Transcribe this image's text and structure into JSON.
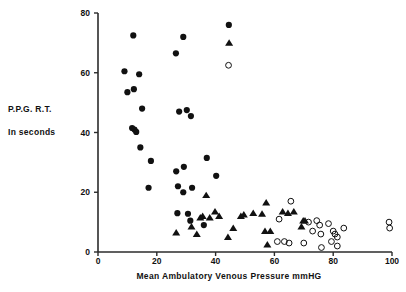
{
  "figure": {
    "background": "#ffffff",
    "foreground": "#111111",
    "axis_color": "#2b2b2b"
  },
  "labels": {
    "ylabel_line1": "P.P.G. R.T.",
    "ylabel_line2": "In seconds",
    "xlabel": "Mean Ambulatory Venous Pressure mmHG"
  },
  "chart_data": {
    "type": "scatter",
    "title": "",
    "xlabel": "Mean Ambulatory Venous Pressure mmHG",
    "ylabel": "P.P.G. R.T. In seconds",
    "xlim": [
      0,
      100
    ],
    "ylim": [
      0,
      80
    ],
    "xticks": [
      0,
      20,
      40,
      60,
      80,
      100
    ],
    "yticks": [
      0,
      20,
      40,
      60,
      80
    ],
    "grid": false,
    "legend": "none",
    "series": [
      {
        "name": "filled-circle",
        "marker": "filled-circle",
        "color": "#111111",
        "points": [
          [
            12.0,
            72.5
          ],
          [
            9.0,
            60.5
          ],
          [
            14.0,
            59.5
          ],
          [
            10.0,
            53.5
          ],
          [
            12.2,
            54.5
          ],
          [
            11.6,
            41.5
          ],
          [
            12.4,
            41.0
          ],
          [
            13.0,
            40.2
          ],
          [
            15.0,
            48.0
          ],
          [
            14.4,
            35.0
          ],
          [
            18.0,
            30.5
          ],
          [
            17.2,
            21.5
          ],
          [
            26.5,
            66.5
          ],
          [
            29.0,
            72.0
          ],
          [
            27.6,
            47.0
          ],
          [
            30.2,
            47.5
          ],
          [
            31.6,
            45.5
          ],
          [
            26.6,
            27.0
          ],
          [
            29.2,
            28.5
          ],
          [
            27.2,
            22.0
          ],
          [
            29.0,
            20.0
          ],
          [
            32.0,
            21.5
          ],
          [
            37.0,
            31.5
          ],
          [
            40.2,
            25.5
          ],
          [
            44.5,
            76.0
          ],
          [
            27.0,
            13.0
          ],
          [
            30.6,
            12.8
          ],
          [
            31.4,
            10.5
          ],
          [
            36.0,
            9.0
          ]
        ]
      },
      {
        "name": "filled-triangle",
        "marker": "filled-triangle",
        "color": "#111111",
        "points": [
          [
            44.6,
            70.0
          ],
          [
            36.8,
            19.0
          ],
          [
            26.6,
            6.5
          ],
          [
            31.8,
            8.5
          ],
          [
            33.6,
            6.0
          ],
          [
            34.8,
            11.5
          ],
          [
            35.6,
            12.0
          ],
          [
            38.0,
            11.5
          ],
          [
            39.8,
            13.5
          ],
          [
            41.2,
            12.0
          ],
          [
            44.2,
            5.0
          ],
          [
            46.0,
            8.0
          ],
          [
            48.6,
            12.0
          ],
          [
            49.6,
            12.5
          ],
          [
            52.8,
            13.0
          ],
          [
            55.8,
            12.8
          ],
          [
            57.2,
            16.5
          ],
          [
            56.8,
            7.0
          ],
          [
            58.6,
            7.0
          ],
          [
            57.6,
            2.5
          ],
          [
            62.8,
            13.5
          ],
          [
            64.6,
            13.0
          ],
          [
            66.6,
            13.5
          ],
          [
            69.8,
            10.5
          ],
          [
            69.2,
            8.5
          ],
          [
            70.4,
            10.5
          ]
        ]
      },
      {
        "name": "open-circle",
        "marker": "open-circle",
        "color": "#111111",
        "points": [
          [
            44.4,
            62.5
          ],
          [
            65.6,
            17.0
          ],
          [
            61.6,
            11.0
          ],
          [
            61.0,
            3.5
          ],
          [
            63.4,
            3.5
          ],
          [
            65.0,
            3.0
          ],
          [
            70.0,
            3.0
          ],
          [
            71.6,
            10.0
          ],
          [
            73.0,
            7.0
          ],
          [
            74.4,
            10.5
          ],
          [
            75.4,
            9.0
          ],
          [
            75.8,
            6.0
          ],
          [
            76.0,
            1.5
          ],
          [
            78.4,
            9.5
          ],
          [
            79.4,
            3.5
          ],
          [
            80.0,
            7.0
          ],
          [
            80.6,
            6.0
          ],
          [
            81.4,
            5.0
          ],
          [
            81.4,
            2.0
          ],
          [
            83.6,
            8.0
          ],
          [
            99.0,
            10.0
          ],
          [
            99.2,
            8.0
          ]
        ]
      }
    ]
  }
}
